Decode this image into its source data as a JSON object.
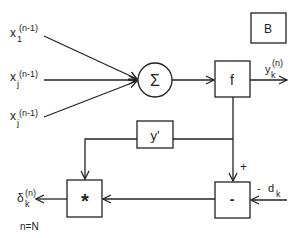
{
  "diagram": {
    "inputs": [
      {
        "base": "x",
        "sub": "1",
        "sup": "(n-1)"
      },
      {
        "base": "x",
        "sub": "j",
        "sup": "(n-1)"
      },
      {
        "base": "x",
        "sub": "j",
        "sup": "(n-1)"
      }
    ],
    "sum_node": {
      "symbol": "Σ"
    },
    "activation_box": {
      "label": "f"
    },
    "output": {
      "base": "y",
      "sub": "k",
      "sup": "(n)"
    },
    "corner_box": {
      "label": "B"
    },
    "derivative_box": {
      "label": "y'"
    },
    "multiply_box": {
      "label": "*"
    },
    "subtract_box": {
      "label": "-"
    },
    "plus_sign": "+",
    "target": {
      "sign": "-",
      "base": "d",
      "sub": "k"
    },
    "delta_output": {
      "base": "δ",
      "sub": "k",
      "sup": "(n)"
    },
    "condition": "n=N"
  }
}
